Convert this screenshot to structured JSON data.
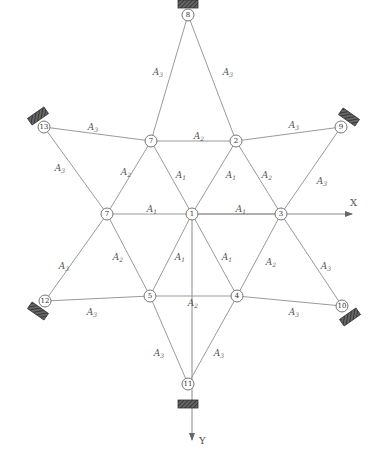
{
  "diagram": {
    "type": "star-shaped truss / cable net",
    "axes": {
      "x_label": "X",
      "y_label": "Y"
    },
    "colors": {
      "member": "#9a9a9a",
      "node_stroke": "#777777",
      "support_fill": "#555555"
    },
    "nodes": [
      {
        "id": "n1",
        "label": "1",
        "x": 192,
        "y": 214
      },
      {
        "id": "n2",
        "label": "2",
        "x": 236,
        "y": 141
      },
      {
        "id": "n3",
        "label": "3",
        "x": 281,
        "y": 214
      },
      {
        "id": "n4",
        "label": "4",
        "x": 237,
        "y": 296
      },
      {
        "id": "n5",
        "label": "5",
        "x": 150,
        "y": 296
      },
      {
        "id": "n6",
        "label": "7",
        "x": 151,
        "y": 141
      },
      {
        "id": "n7",
        "label": "7",
        "x": 107,
        "y": 214
      },
      {
        "id": "n8",
        "label": "8",
        "x": 188,
        "y": 15
      },
      {
        "id": "n9",
        "label": "9",
        "x": 341,
        "y": 127
      },
      {
        "id": "n10",
        "label": "10",
        "x": 342,
        "y": 306
      },
      {
        "id": "n11",
        "label": "11",
        "x": 188,
        "y": 384
      },
      {
        "id": "n12",
        "label": "12",
        "x": 45,
        "y": 301
      },
      {
        "id": "n13",
        "label": "13",
        "x": 44,
        "y": 127
      }
    ],
    "members": [
      {
        "from": "n8",
        "to": "n6",
        "area": "A",
        "sub": "3",
        "lx": 158,
        "ly": 72
      },
      {
        "from": "n8",
        "to": "n2",
        "area": "A",
        "sub": "3",
        "lx": 228,
        "ly": 72
      },
      {
        "from": "n13",
        "to": "n6",
        "area": "A",
        "sub": "3",
        "lx": 93,
        "ly": 127
      },
      {
        "from": "n6",
        "to": "n2",
        "area": "A",
        "sub": "2",
        "lx": 199,
        "ly": 136
      },
      {
        "from": "n2",
        "to": "n9",
        "area": "A",
        "sub": "3",
        "lx": 294,
        "ly": 125
      },
      {
        "from": "n13",
        "to": "n7",
        "area": "A",
        "sub": "3",
        "lx": 60,
        "ly": 168
      },
      {
        "from": "n6",
        "to": "n7",
        "area": "A",
        "sub": "2",
        "lx": 126,
        "ly": 172
      },
      {
        "from": "n6",
        "to": "n1",
        "area": "A",
        "sub": "1",
        "lx": 181,
        "ly": 175
      },
      {
        "from": "n2",
        "to": "n1",
        "area": "A",
        "sub": "1",
        "lx": 231,
        "ly": 175
      },
      {
        "from": "n2",
        "to": "n3",
        "area": "A",
        "sub": "2",
        "lx": 267,
        "ly": 175
      },
      {
        "from": "n9",
        "to": "n3",
        "area": "A",
        "sub": "3",
        "lx": 322,
        "ly": 181
      },
      {
        "from": "n7",
        "to": "n1",
        "area": "A",
        "sub": "1",
        "lx": 152,
        "ly": 209
      },
      {
        "from": "n1",
        "to": "n3",
        "area": "A",
        "sub": "1",
        "lx": 241,
        "ly": 209
      },
      {
        "from": "n7",
        "to": "n12",
        "area": "A",
        "sub": "3",
        "lx": 64,
        "ly": 266
      },
      {
        "from": "n7",
        "to": "n5",
        "area": "A",
        "sub": "2",
        "lx": 118,
        "ly": 257
      },
      {
        "from": "n1",
        "to": "n5",
        "area": "A",
        "sub": "1",
        "lx": 180,
        "ly": 257
      },
      {
        "from": "n1",
        "to": "n4",
        "area": "A",
        "sub": "1",
        "lx": 227,
        "ly": 257
      },
      {
        "from": "n3",
        "to": "n4",
        "area": "A",
        "sub": "2",
        "lx": 271,
        "ly": 262
      },
      {
        "from": "n3",
        "to": "n10",
        "area": "A",
        "sub": "3",
        "lx": 326,
        "ly": 266
      },
      {
        "from": "n12",
        "to": "n5",
        "area": "A",
        "sub": "3",
        "lx": 92,
        "ly": 312
      },
      {
        "from": "n5",
        "to": "n4",
        "area": "A",
        "sub": "2",
        "lx": 193,
        "ly": 303
      },
      {
        "from": "n4",
        "to": "n10",
        "area": "A",
        "sub": "3",
        "lx": 294,
        "ly": 312
      },
      {
        "from": "n5",
        "to": "n11",
        "area": "A",
        "sub": "3",
        "lx": 159,
        "ly": 353
      },
      {
        "from": "n4",
        "to": "n11",
        "area": "A",
        "sub": "3",
        "lx": 219,
        "ly": 353
      }
    ],
    "supports": [
      {
        "node": "n8",
        "x": 188,
        "y": 4,
        "angle": 0
      },
      {
        "node": "n13",
        "x": 38,
        "y": 116,
        "angle": -35
      },
      {
        "node": "n9",
        "x": 349,
        "y": 117,
        "angle": 35
      },
      {
        "node": "n12",
        "x": 38,
        "y": 311,
        "angle": 35
      },
      {
        "node": "n10",
        "x": 350,
        "y": 317,
        "angle": -35
      },
      {
        "node": "n11",
        "x": 188,
        "y": 404,
        "angle": 0
      }
    ]
  }
}
